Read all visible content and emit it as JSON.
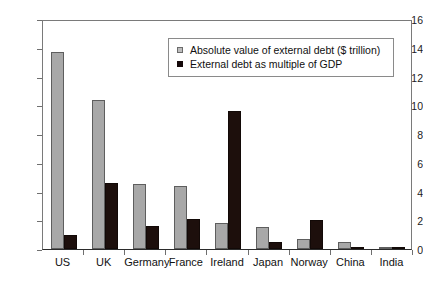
{
  "chart_data": {
    "type": "bar",
    "title": "",
    "xlabel": "",
    "ylabel": "",
    "ylim": [
      0,
      16
    ],
    "yticks": [
      0,
      2,
      4,
      6,
      8,
      10,
      12,
      14,
      16
    ],
    "ytick_labels": [
      "0",
      "2",
      "4",
      "6",
      "8",
      "10",
      "12",
      "14",
      "16"
    ],
    "grid": false,
    "legend_position": "top-right",
    "categories": [
      "US",
      "UK",
      "Germany",
      "France",
      "Ireland",
      "Japan",
      "Norway",
      "China",
      "India"
    ],
    "series": [
      {
        "name": "Absolute value of external debt ($ trillion)",
        "color": "#a8a8a8",
        "values": [
          13.7,
          10.4,
          4.5,
          4.4,
          1.8,
          1.5,
          0.7,
          0.5,
          0.1
        ]
      },
      {
        "name": "External debt as multiple of GDP",
        "color": "#1d0f0c",
        "values": [
          1.0,
          4.6,
          1.6,
          2.1,
          9.6,
          0.5,
          2.0,
          0.1,
          0.1
        ]
      }
    ]
  },
  "legend": {
    "items": [
      {
        "label": "Absolute value of external debt ($ trillion)",
        "swatch": "series-a-swatch-icon"
      },
      {
        "label": "External debt as multiple of GDP",
        "swatch": "series-b-swatch-icon"
      }
    ]
  }
}
